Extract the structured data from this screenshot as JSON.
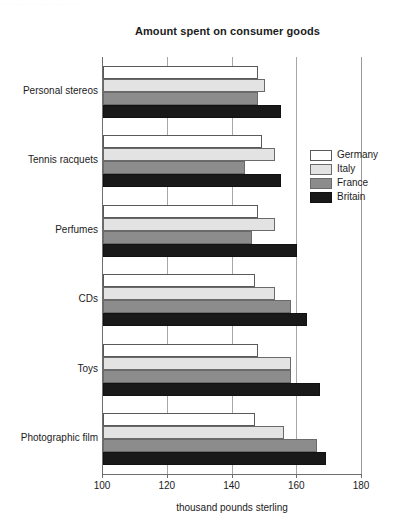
{
  "scan_residue_text": "···· ···· ·· ····· ····· ····",
  "chart_data": {
    "type": "bar",
    "orientation": "horizontal",
    "title": "Amount spent on consumer goods",
    "xlabel": "thousand pounds sterling",
    "ylabel": "",
    "xlim": [
      100,
      180
    ],
    "xticks": [
      100,
      120,
      140,
      160,
      180
    ],
    "xtick_labels": [
      "100",
      "120",
      "140",
      "160",
      "180"
    ],
    "grid": true,
    "grid_axis": "x",
    "legend_position": "right",
    "categories": [
      "Personal stereos",
      "Tennis racquets",
      "Perfumes",
      "CDs",
      "Toys",
      "Photographic film"
    ],
    "series": [
      {
        "name": "Germany",
        "color": "#ffffff",
        "values": [
          148,
          149,
          148,
          147,
          148,
          147
        ]
      },
      {
        "name": "Italy",
        "color": "#e3e3e3",
        "values": [
          150,
          153,
          153,
          153,
          158,
          156
        ]
      },
      {
        "name": "France",
        "color": "#8c8c8c",
        "values": [
          148,
          144,
          146,
          158,
          158,
          166
        ]
      },
      {
        "name": "Britain",
        "color": "#191919",
        "values": [
          155,
          155,
          160,
          163,
          167,
          169
        ]
      }
    ]
  }
}
